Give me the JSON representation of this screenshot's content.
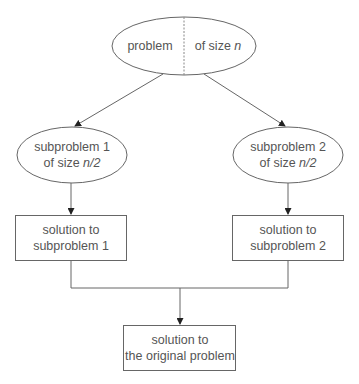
{
  "diagram": {
    "type": "divide-and-conquer flowchart",
    "colors": {
      "stroke": "#666666",
      "text": "#555555",
      "background": "#ffffff"
    },
    "nodes": {
      "root": {
        "shape": "ellipse",
        "left_text": "problem",
        "right_text_prefix": "of size ",
        "right_text_var": "n"
      },
      "sub1": {
        "shape": "ellipse",
        "line1": "subproblem 1",
        "line2_prefix": "of size ",
        "line2_var": "n/2"
      },
      "sub2": {
        "shape": "ellipse",
        "line1": "subproblem 2",
        "line2_prefix": "of size ",
        "line2_var": "n/2"
      },
      "sol1": {
        "shape": "rectangle",
        "line1": "solution to",
        "line2": "subproblem 1"
      },
      "sol2": {
        "shape": "rectangle",
        "line1": "solution to",
        "line2": "subproblem 2"
      },
      "final": {
        "shape": "rectangle",
        "line1": "solution to",
        "line2": "the original problem"
      }
    },
    "edges": [
      {
        "from": "root",
        "to": "sub1",
        "arrow": true
      },
      {
        "from": "root",
        "to": "sub2",
        "arrow": true
      },
      {
        "from": "sub1",
        "to": "sol1",
        "arrow": true
      },
      {
        "from": "sub2",
        "to": "sol2",
        "arrow": true
      },
      {
        "from": "sol1",
        "to": "final",
        "arrow": true,
        "merge": true
      },
      {
        "from": "sol2",
        "to": "final",
        "arrow": true,
        "merge": true
      }
    ]
  }
}
